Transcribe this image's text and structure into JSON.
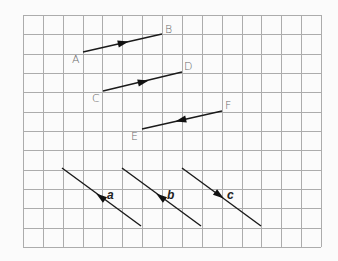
{
  "grid": {
    "origin_x": 23,
    "origin_y": 15,
    "cols": 15,
    "rows": 12,
    "cell_w": 19.87,
    "cell_h": 19.33,
    "line_color": "#acacac",
    "background": "#fbfbfb"
  },
  "vectors": [
    {
      "id": "AB",
      "from": {
        "label": "A",
        "col": 3,
        "row": 2
      },
      "to": {
        "label": "B",
        "col": 7,
        "row": 1
      },
      "arrow_direction": "toward-B"
    },
    {
      "id": "CD",
      "from": {
        "label": "C",
        "col": 4,
        "row": 4
      },
      "to": {
        "label": "D",
        "col": 8,
        "row": 3
      },
      "arrow_direction": "toward-D"
    },
    {
      "id": "EF",
      "from": {
        "label": "E",
        "col": 6,
        "row": 6
      },
      "to": {
        "label": "F",
        "col": 10,
        "row": 5
      },
      "arrow_direction": "toward-E"
    },
    {
      "id": "a",
      "label": "a",
      "start": {
        "col": 2,
        "row": 8
      },
      "end": {
        "col": 6,
        "row": 11
      },
      "arrow_direction": "up-left"
    },
    {
      "id": "b",
      "label": "b",
      "start": {
        "col": 5,
        "row": 8
      },
      "end": {
        "col": 9,
        "row": 11
      },
      "arrow_direction": "up-left"
    },
    {
      "id": "c",
      "label": "c",
      "start": {
        "col": 8,
        "row": 8
      },
      "end": {
        "col": 12,
        "row": 11
      },
      "arrow_direction": "down-right"
    }
  ],
  "labels": {
    "A": "A",
    "B": "B",
    "C": "C",
    "D": "D",
    "E": "E",
    "F": "F",
    "a": "a",
    "b": "b",
    "c": "c"
  }
}
